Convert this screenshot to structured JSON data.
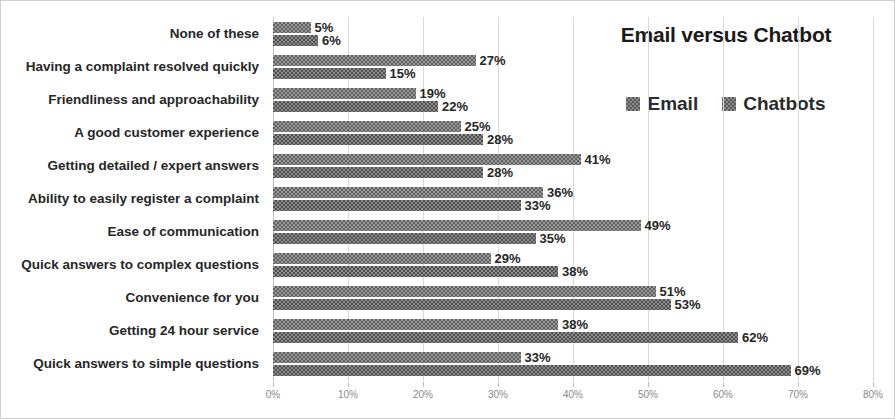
{
  "chart_data": {
    "type": "bar",
    "orientation": "horizontal",
    "title": "Email versus Chatbot",
    "xlabel": "",
    "ylabel": "",
    "xlim": [
      0,
      80
    ],
    "xticks": [
      "0%",
      "10%",
      "20%",
      "30%",
      "40%",
      "50%",
      "60%",
      "70%",
      "80%"
    ],
    "grid": true,
    "legend_position": "top-right",
    "value_suffix": "%",
    "categories": [
      "None of these",
      "Having a complaint resolved quickly",
      "Friendliness and approachability",
      "A good customer experience",
      "Getting detailed / expert answers",
      "Ability to easily register a complaint",
      "Ease of communication",
      "Quick answers to complex questions",
      "Convenience for you",
      "Getting 24 hour service",
      "Quick answers to simple questions"
    ],
    "series": [
      {
        "name": "Email",
        "color": "#9a9a9a",
        "values": [
          5,
          27,
          19,
          25,
          41,
          36,
          49,
          29,
          51,
          38,
          33
        ],
        "labels": [
          "5%",
          "27%",
          "19%",
          "25%",
          "41%",
          "36%",
          "49%",
          "29%",
          "51%",
          "38%",
          "33%"
        ]
      },
      {
        "name": "Chatbots",
        "color": "#8e8e8e",
        "values": [
          6,
          15,
          22,
          28,
          28,
          33,
          35,
          38,
          53,
          62,
          69
        ],
        "labels": [
          "6%",
          "15%",
          "22%",
          "28%",
          "28%",
          "33%",
          "35%",
          "38%",
          "53%",
          "62%",
          "69%"
        ]
      }
    ]
  }
}
